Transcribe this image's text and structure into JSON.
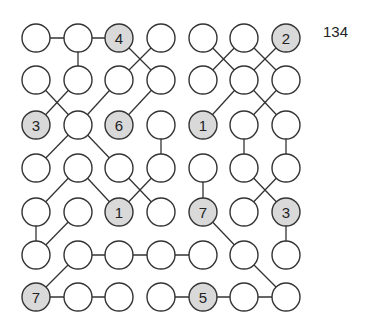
{
  "puzzle": {
    "id_label": "134",
    "colors": {
      "stroke": "#333333",
      "empty_fill": "#ffffff",
      "given_fill": "#d9d9d9",
      "text": "#222222"
    },
    "grid": {
      "cols_x": [
        36,
        78,
        119,
        161,
        203,
        244,
        286
      ],
      "rows_y": [
        38,
        80,
        125,
        168,
        212,
        255,
        297
      ],
      "radius": 14
    },
    "nodes": [
      {
        "r": 0,
        "c": 0,
        "v": ""
      },
      {
        "r": 0,
        "c": 1,
        "v": ""
      },
      {
        "r": 0,
        "c": 2,
        "v": "4"
      },
      {
        "r": 0,
        "c": 3,
        "v": ""
      },
      {
        "r": 0,
        "c": 4,
        "v": ""
      },
      {
        "r": 0,
        "c": 5,
        "v": ""
      },
      {
        "r": 0,
        "c": 6,
        "v": "2"
      },
      {
        "r": 1,
        "c": 0,
        "v": ""
      },
      {
        "r": 1,
        "c": 1,
        "v": ""
      },
      {
        "r": 1,
        "c": 2,
        "v": ""
      },
      {
        "r": 1,
        "c": 3,
        "v": ""
      },
      {
        "r": 1,
        "c": 4,
        "v": ""
      },
      {
        "r": 1,
        "c": 5,
        "v": ""
      },
      {
        "r": 1,
        "c": 6,
        "v": ""
      },
      {
        "r": 2,
        "c": 0,
        "v": "3"
      },
      {
        "r": 2,
        "c": 1,
        "v": ""
      },
      {
        "r": 2,
        "c": 2,
        "v": "6"
      },
      {
        "r": 2,
        "c": 3,
        "v": ""
      },
      {
        "r": 2,
        "c": 4,
        "v": "1"
      },
      {
        "r": 2,
        "c": 5,
        "v": ""
      },
      {
        "r": 2,
        "c": 6,
        "v": ""
      },
      {
        "r": 3,
        "c": 0,
        "v": ""
      },
      {
        "r": 3,
        "c": 1,
        "v": ""
      },
      {
        "r": 3,
        "c": 2,
        "v": ""
      },
      {
        "r": 3,
        "c": 3,
        "v": ""
      },
      {
        "r": 3,
        "c": 4,
        "v": ""
      },
      {
        "r": 3,
        "c": 5,
        "v": ""
      },
      {
        "r": 3,
        "c": 6,
        "v": ""
      },
      {
        "r": 4,
        "c": 0,
        "v": ""
      },
      {
        "r": 4,
        "c": 1,
        "v": ""
      },
      {
        "r": 4,
        "c": 2,
        "v": "1"
      },
      {
        "r": 4,
        "c": 3,
        "v": ""
      },
      {
        "r": 4,
        "c": 4,
        "v": "7"
      },
      {
        "r": 4,
        "c": 5,
        "v": ""
      },
      {
        "r": 4,
        "c": 6,
        "v": "3"
      },
      {
        "r": 5,
        "c": 0,
        "v": ""
      },
      {
        "r": 5,
        "c": 1,
        "v": ""
      },
      {
        "r": 5,
        "c": 2,
        "v": ""
      },
      {
        "r": 5,
        "c": 3,
        "v": ""
      },
      {
        "r": 5,
        "c": 4,
        "v": ""
      },
      {
        "r": 5,
        "c": 5,
        "v": ""
      },
      {
        "r": 5,
        "c": 6,
        "v": ""
      },
      {
        "r": 6,
        "c": 0,
        "v": "7"
      },
      {
        "r": 6,
        "c": 1,
        "v": ""
      },
      {
        "r": 6,
        "c": 2,
        "v": ""
      },
      {
        "r": 6,
        "c": 3,
        "v": ""
      },
      {
        "r": 6,
        "c": 4,
        "v": "5"
      },
      {
        "r": 6,
        "c": 5,
        "v": ""
      },
      {
        "r": 6,
        "c": 6,
        "v": ""
      }
    ],
    "edges": [
      [
        [
          0,
          0
        ],
        [
          0,
          1
        ]
      ],
      [
        [
          0,
          1
        ],
        [
          0,
          2
        ]
      ],
      [
        [
          0,
          1
        ],
        [
          1,
          1
        ]
      ],
      [
        [
          0,
          2
        ],
        [
          1,
          3
        ]
      ],
      [
        [
          0,
          3
        ],
        [
          1,
          2
        ]
      ],
      [
        [
          0,
          4
        ],
        [
          1,
          5
        ]
      ],
      [
        [
          0,
          5
        ],
        [
          1,
          4
        ]
      ],
      [
        [
          0,
          5
        ],
        [
          1,
          6
        ]
      ],
      [
        [
          0,
          6
        ],
        [
          1,
          5
        ]
      ],
      [
        [
          1,
          0
        ],
        [
          2,
          1
        ]
      ],
      [
        [
          1,
          1
        ],
        [
          2,
          0
        ]
      ],
      [
        [
          1,
          2
        ],
        [
          2,
          1
        ]
      ],
      [
        [
          1,
          3
        ],
        [
          2,
          2
        ]
      ],
      [
        [
          1,
          5
        ],
        [
          2,
          4
        ]
      ],
      [
        [
          1,
          5
        ],
        [
          2,
          6
        ]
      ],
      [
        [
          1,
          6
        ],
        [
          2,
          5
        ]
      ],
      [
        [
          2,
          1
        ],
        [
          3,
          0
        ]
      ],
      [
        [
          2,
          1
        ],
        [
          3,
          2
        ]
      ],
      [
        [
          2,
          3
        ],
        [
          3,
          3
        ]
      ],
      [
        [
          2,
          5
        ],
        [
          3,
          5
        ]
      ],
      [
        [
          2,
          6
        ],
        [
          3,
          6
        ]
      ],
      [
        [
          3,
          1
        ],
        [
          4,
          0
        ]
      ],
      [
        [
          3,
          1
        ],
        [
          4,
          2
        ]
      ],
      [
        [
          3,
          2
        ],
        [
          4,
          3
        ]
      ],
      [
        [
          3,
          3
        ],
        [
          4,
          2
        ]
      ],
      [
        [
          3,
          4
        ],
        [
          4,
          4
        ]
      ],
      [
        [
          3,
          5
        ],
        [
          4,
          6
        ]
      ],
      [
        [
          3,
          6
        ],
        [
          4,
          5
        ]
      ],
      [
        [
          4,
          0
        ],
        [
          5,
          0
        ]
      ],
      [
        [
          4,
          1
        ],
        [
          5,
          0
        ]
      ],
      [
        [
          4,
          4
        ],
        [
          5,
          5
        ]
      ],
      [
        [
          4,
          6
        ],
        [
          5,
          6
        ]
      ],
      [
        [
          5,
          1
        ],
        [
          5,
          2
        ]
      ],
      [
        [
          5,
          2
        ],
        [
          5,
          3
        ]
      ],
      [
        [
          5,
          3
        ],
        [
          5,
          4
        ]
      ],
      [
        [
          5,
          1
        ],
        [
          6,
          0
        ]
      ],
      [
        [
          5,
          5
        ],
        [
          6,
          6
        ]
      ],
      [
        [
          6,
          0
        ],
        [
          6,
          1
        ]
      ],
      [
        [
          6,
          1
        ],
        [
          6,
          2
        ]
      ],
      [
        [
          6,
          3
        ],
        [
          6,
          4
        ]
      ],
      [
        [
          6,
          4
        ],
        [
          6,
          5
        ]
      ],
      [
        [
          6,
          5
        ],
        [
          6,
          6
        ]
      ]
    ]
  }
}
